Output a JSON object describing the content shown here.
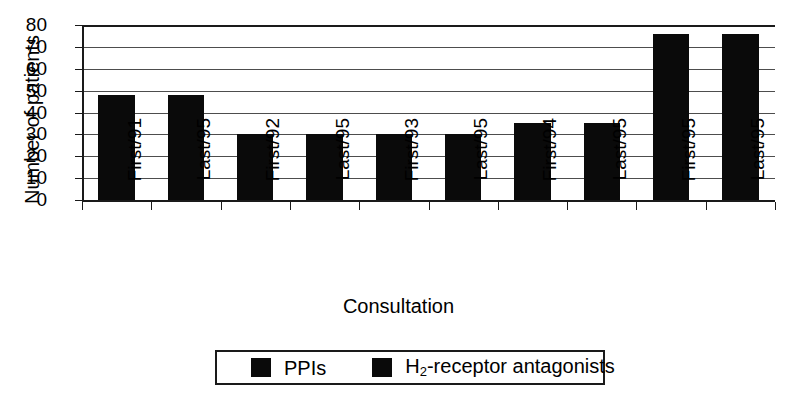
{
  "chart_data": {
    "type": "bar",
    "title": "",
    "xlabel": "Consultation",
    "ylabel": "Number of patients",
    "ylim": [
      0,
      80
    ],
    "ytick_step": 10,
    "yticks": [
      80,
      70,
      60,
      50,
      40,
      30,
      20,
      10,
      0
    ],
    "grid": true,
    "categories": [
      "First/91",
      "Last/95",
      "First/92",
      "Last/95",
      "First/93",
      "Last/95",
      "First/94",
      "Last/95",
      "First/95",
      "Last/95"
    ],
    "values": [
      48,
      48,
      30,
      30,
      30,
      30,
      35,
      35,
      76,
      76
    ],
    "bar_color": "#0a0a0a",
    "legend_position": "bottom",
    "legend": [
      {
        "label": "PPIs",
        "swatch_color": "#0a0a0a"
      },
      {
        "label": "H2-receptor antagonists",
        "swatch_color": "#0a0a0a"
      }
    ]
  },
  "legend": {
    "items": [
      {
        "label": "PPIs",
        "label_prefix": "PPIs",
        "sub": "",
        "label_suffix": ""
      },
      {
        "label": "H2-receptor antagonists",
        "label_prefix": "H",
        "sub": "2",
        "label_suffix": "-receptor antagonists"
      }
    ]
  }
}
